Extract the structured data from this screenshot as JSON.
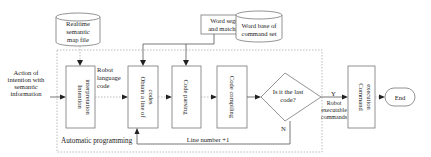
{
  "diagram": {
    "sources": {
      "semantic_map": [
        "Realtime",
        "semantic",
        "map file"
      ],
      "word_segmentation": [
        "Word segmentation",
        "and matching system"
      ],
      "word_base": [
        "Word base of",
        "command set"
      ]
    },
    "input_label": [
      "Action of",
      "intention with",
      "semantic",
      "information"
    ],
    "steps": {
      "intention": [
        "Intention",
        "interpretation"
      ],
      "obtain": [
        "Obtain a line of",
        "codes"
      ],
      "parsing": [
        "Code parsing"
      ],
      "compiling": [
        "Code compiling"
      ],
      "execution": [
        "Command",
        "execution"
      ]
    },
    "decision": [
      "Is it the last",
      "code?"
    ],
    "end_label": "End",
    "edge_labels": {
      "robot_language": [
        "Robot",
        "language",
        "code"
      ],
      "yes": "Y",
      "no": "N",
      "robot_exec": [
        "Robot",
        "executable",
        "commands"
      ],
      "line_number": "Line number +1"
    },
    "container_label": "Automatic programming"
  }
}
